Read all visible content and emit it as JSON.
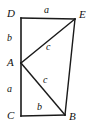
{
  "figure": {
    "background_color": "#ffffff",
    "stroke_color": "#1a1a1a",
    "text_color": "#111111",
    "width": 94,
    "height": 130,
    "vertices": [
      {
        "id": "D",
        "label": "D",
        "x": 21,
        "y": 18
      },
      {
        "id": "E",
        "label": "E",
        "x": 75,
        "y": 19
      },
      {
        "id": "A",
        "label": "A",
        "x": 21,
        "y": 63
      },
      {
        "id": "C",
        "label": "C",
        "x": 21,
        "y": 116
      },
      {
        "id": "B",
        "label": "B",
        "x": 65,
        "y": 115
      }
    ],
    "segments": [
      {
        "id": "DE",
        "from": "D",
        "to": "E",
        "label": "a",
        "x1": 21,
        "y1": 18,
        "x2": 75,
        "y2": 19,
        "width": 1.6
      },
      {
        "id": "DA",
        "from": "D",
        "to": "A",
        "label": "b",
        "x1": 21,
        "y1": 18,
        "x2": 21,
        "y2": 63,
        "width": 1.6
      },
      {
        "id": "AC",
        "from": "A",
        "to": "C",
        "label": "a",
        "x1": 21,
        "y1": 63,
        "x2": 21,
        "y2": 116,
        "width": 1.6
      },
      {
        "id": "CB",
        "from": "C",
        "to": "B",
        "label": "b",
        "x1": 21,
        "y1": 116,
        "x2": 65,
        "y2": 115,
        "width": 1.6
      },
      {
        "id": "AE",
        "from": "A",
        "to": "E",
        "label": "c",
        "x1": 21,
        "y1": 63,
        "x2": 75,
        "y2": 19,
        "width": 1.4
      },
      {
        "id": "AB",
        "from": "A",
        "to": "B",
        "label": "c",
        "x1": 21,
        "y1": 63,
        "x2": 65,
        "y2": 115,
        "width": 1.4
      },
      {
        "id": "EB",
        "from": "E",
        "to": "B",
        "label": "",
        "x1": 75,
        "y1": 19,
        "x2": 65,
        "y2": 115,
        "width": 1.4
      }
    ],
    "side_labels": {
      "de": "a",
      "da": "b",
      "ac": "a",
      "cb": "b",
      "ae": "c",
      "ab": "c"
    }
  }
}
